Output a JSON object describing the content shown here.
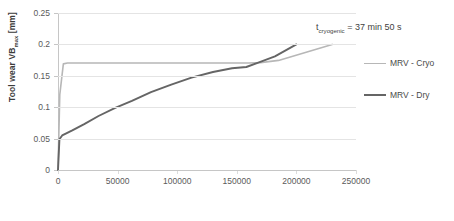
{
  "chart_data": {
    "type": "line",
    "title": "",
    "xlabel": "Cut volume [mm3]",
    "xlabel_main": "Cut volume [mm",
    "xlabel_sup": "3",
    "xlabel_tail": "]",
    "ylabel": "Tool wear VBmax [mm]",
    "ylabel_main": "Tool wear VB",
    "ylabel_sub": "max",
    "ylabel_tail": " [mm]",
    "xlim": [
      0,
      250000
    ],
    "ylim": [
      0,
      0.25
    ],
    "x_ticks": [
      "0",
      "50000",
      "100000",
      "150000",
      "200000",
      "250000"
    ],
    "x_tick_values": [
      0,
      50000,
      100000,
      150000,
      200000,
      250000
    ],
    "y_ticks": [
      "0",
      "0.05",
      "0.1",
      "0.15",
      "0.2",
      "0.25"
    ],
    "y_tick_values": [
      0,
      0.05,
      0.1,
      0.15,
      0.2,
      0.25
    ],
    "grid": "horizontal",
    "legend_position": "right",
    "annotations": [
      {
        "name": "cryogenic-time-annotation",
        "text_main": "t",
        "text_sub": "cryogenic",
        "text_tail": " = 37 min 50 s",
        "full_text": "tcryogenic = 37 min 50 s"
      }
    ],
    "series": [
      {
        "name": "MRV - Cryo",
        "color": "#b7b7b7",
        "width": 1.6,
        "points": [
          [
            0,
            0.0
          ],
          [
            1500,
            0.12
          ],
          [
            4500,
            0.169
          ],
          [
            8000,
            0.1705
          ],
          [
            60000,
            0.1705
          ],
          [
            120000,
            0.1705
          ],
          [
            160000,
            0.1705
          ],
          [
            170000,
            0.171
          ],
          [
            185000,
            0.1745
          ],
          [
            230000,
            0.2
          ]
        ]
      },
      {
        "name": "MRV - Dry",
        "color": "#656565",
        "width": 1.9,
        "points": [
          [
            0,
            0.0
          ],
          [
            1200,
            0.049
          ],
          [
            3500,
            0.055
          ],
          [
            6500,
            0.058
          ],
          [
            12000,
            0.063
          ],
          [
            22000,
            0.073
          ],
          [
            34000,
            0.086
          ],
          [
            48000,
            0.099
          ],
          [
            62000,
            0.11
          ],
          [
            78000,
            0.124
          ],
          [
            95000,
            0.136
          ],
          [
            112000,
            0.147
          ],
          [
            130000,
            0.156
          ],
          [
            146000,
            0.162
          ],
          [
            158000,
            0.164
          ],
          [
            168000,
            0.171
          ],
          [
            182000,
            0.181
          ],
          [
            200000,
            0.2
          ]
        ]
      }
    ]
  },
  "legend": {
    "items": [
      {
        "label": "MRV - Cryo",
        "color": "#b7b7b7",
        "width": 1.6
      },
      {
        "label": "MRV - Dry",
        "color": "#656565",
        "width": 2.2
      }
    ]
  },
  "colors": {
    "cryo": "#b7b7b7",
    "dry": "#656565",
    "grid": "#e4e4e4",
    "axis": "#c6c6c6",
    "text": "#5a5a5a",
    "title_text": "#3b3b3b",
    "background": "#ffffff"
  }
}
